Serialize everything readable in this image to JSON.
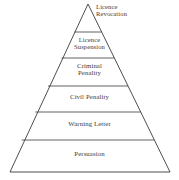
{
  "figure": {
    "name": "enforcement-pyramid",
    "type": "pyramid",
    "orientation": "apex-top",
    "background_color": "#ffffff",
    "stroke_color": "#3a3a3a",
    "text_color": "#3b3b3b",
    "canvas": {
      "width": 179,
      "height": 180
    }
  },
  "geometry": {
    "apex": {
      "x": 88,
      "y": 4
    },
    "base_left": {
      "x": 10,
      "y": 172
    },
    "base_right": {
      "x": 170,
      "y": 172
    },
    "divider_y": [
      32,
      58,
      86,
      112,
      140
    ]
  },
  "tiers": [
    {
      "index": 1,
      "label": "Licence\nRevocation",
      "label_flat": "Licence Revocation",
      "lines": [
        "Licence",
        "Revocation"
      ],
      "label_placement": "outside-right-of-apex",
      "label_x": 96,
      "label_y": 3,
      "font_size": 6.6
    },
    {
      "index": 2,
      "label": "Licence\nSuspension",
      "label_flat": "Licence Suspension",
      "lines": [
        "Licence",
        "Suspension"
      ],
      "label_placement": "inside",
      "label_y": 36,
      "font_size": 6.6
    },
    {
      "index": 3,
      "label": "Criminal\nPenality",
      "label_flat": "Criminal Penality",
      "lines": [
        "Criminal",
        "Penality"
      ],
      "label_placement": "inside",
      "label_y": 62,
      "font_size": 6.8
    },
    {
      "index": 4,
      "label": "Civil Penality",
      "label_flat": "Civil Penality",
      "lines": [
        "Civil Penality"
      ],
      "label_placement": "inside",
      "label_y": 93,
      "font_size": 6.8
    },
    {
      "index": 5,
      "label": "Warning Letter",
      "label_flat": "Warning Letter",
      "lines": [
        "Warning Letter"
      ],
      "label_placement": "inside",
      "label_y": 120,
      "font_size": 6.8
    },
    {
      "index": 6,
      "label": "Persuasion",
      "label_flat": "Persuasion",
      "lines": [
        "Persuasion"
      ],
      "label_placement": "inside",
      "label_y": 150,
      "font_size": 6.8
    }
  ]
}
